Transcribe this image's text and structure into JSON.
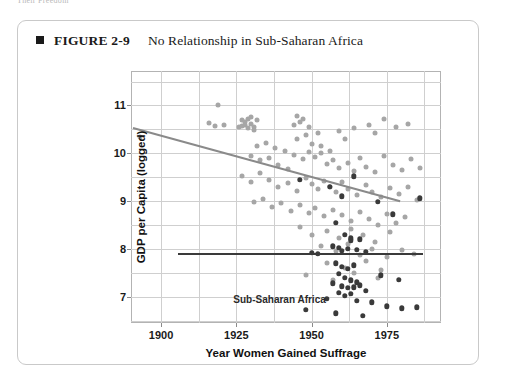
{
  "running_head": "Their Freedom",
  "figure": {
    "bullet_icon": "square-bullet-icon",
    "number": "FIGURE 2-9",
    "title": "No Relationship in Sub-Saharan Africa"
  },
  "colors": {
    "ssa_point": "#3a3a3a",
    "other_point": "#a6a6a6",
    "ssa_trend": "#3a3a3a",
    "other_trend": "#8a8a8a",
    "grid": "#cfcfcf",
    "frame": "#b3b3b3"
  },
  "annotations": {
    "ssa_label": "Sub-Saharan Africa"
  },
  "chart_data": {
    "type": "scatter",
    "title": "No Relationship in Sub-Saharan Africa",
    "xlabel": "Year Women Gained Suffrage",
    "ylabel": "GDP per Capita (logged)",
    "xlim": [
      1890,
      1993
    ],
    "ylim": [
      6.45,
      11.72
    ],
    "xticks": [
      1900,
      1925,
      1950,
      1975
    ],
    "xticklabels": [
      "1900",
      "1925",
      "1950",
      "1975"
    ],
    "yticks": [
      7,
      8,
      9,
      10,
      11
    ],
    "yticklabels": [
      "7",
      "8",
      "9",
      "10",
      "11"
    ],
    "x_minor_step": 12.5,
    "y_minor_step": 0.5,
    "grid": true,
    "legend": "none",
    "series": [
      {
        "name": "Rest of world",
        "color": "#a6a6a6",
        "points": [
          [
            1893,
            10.35
          ],
          [
            1918,
            10.58
          ],
          [
            1921,
            10.59
          ],
          [
            1919,
            11.0
          ],
          [
            1916,
            10.63
          ],
          [
            1927,
            10.7
          ],
          [
            1928,
            10.66
          ],
          [
            1929,
            10.72
          ],
          [
            1928,
            10.6
          ],
          [
            1930,
            10.62
          ],
          [
            1931,
            10.55
          ],
          [
            1927,
            10.58
          ],
          [
            1929,
            10.52
          ],
          [
            1932,
            10.7
          ],
          [
            1930,
            10.75
          ],
          [
            1926,
            10.55
          ],
          [
            1931,
            10.48
          ],
          [
            1945,
            10.78
          ],
          [
            1946,
            10.66
          ],
          [
            1944,
            10.6
          ],
          [
            1947,
            10.72
          ],
          [
            1949,
            10.54
          ],
          [
            1948,
            10.38
          ],
          [
            1945,
            10.3
          ],
          [
            1952,
            10.42
          ],
          [
            1950,
            10.2
          ],
          [
            1953,
            10.15
          ],
          [
            1956,
            10.05
          ],
          [
            1959,
            10.46
          ],
          [
            1961,
            10.3
          ],
          [
            1964,
            10.52
          ],
          [
            1969,
            10.6
          ],
          [
            1971,
            10.43
          ],
          [
            1974,
            10.72
          ],
          [
            1978,
            10.55
          ],
          [
            1982,
            10.62
          ],
          [
            1932,
            10.15
          ],
          [
            1935,
            10.22
          ],
          [
            1938,
            10.1
          ],
          [
            1941,
            10.05
          ],
          [
            1930,
            9.95
          ],
          [
            1933,
            9.86
          ],
          [
            1936,
            9.9
          ],
          [
            1939,
            9.75
          ],
          [
            1942,
            9.68
          ],
          [
            1944,
            9.96
          ],
          [
            1947,
            9.88
          ],
          [
            1949,
            10.02
          ],
          [
            1951,
            9.92
          ],
          [
            1953,
            10.0
          ],
          [
            1955,
            9.78
          ],
          [
            1957,
            9.85
          ],
          [
            1959,
            9.7
          ],
          [
            1962,
            9.8
          ],
          [
            1964,
            9.62
          ],
          [
            1966,
            9.9
          ],
          [
            1968,
            9.72
          ],
          [
            1971,
            9.6
          ],
          [
            1974,
            9.95
          ],
          [
            1977,
            9.75
          ],
          [
            1980,
            9.65
          ],
          [
            1983,
            9.88
          ],
          [
            1986,
            9.7
          ],
          [
            1927,
            9.52
          ],
          [
            1930,
            9.4
          ],
          [
            1933,
            9.58
          ],
          [
            1936,
            9.45
          ],
          [
            1939,
            9.3
          ],
          [
            1942,
            9.38
          ],
          [
            1945,
            9.22
          ],
          [
            1948,
            9.48
          ],
          [
            1950,
            9.35
          ],
          [
            1952,
            9.25
          ],
          [
            1954,
            9.42
          ],
          [
            1956,
            9.3
          ],
          [
            1958,
            9.18
          ],
          [
            1960,
            9.4
          ],
          [
            1962,
            9.26
          ],
          [
            1965,
            9.12
          ],
          [
            1968,
            9.34
          ],
          [
            1970,
            9.2
          ],
          [
            1973,
            9.08
          ],
          [
            1976,
            9.28
          ],
          [
            1979,
            9.14
          ],
          [
            1982,
            9.3
          ],
          [
            1985,
            9.02
          ],
          [
            1931,
            8.98
          ],
          [
            1934,
            9.05
          ],
          [
            1937,
            8.88
          ],
          [
            1940,
            8.95
          ],
          [
            1943,
            8.8
          ],
          [
            1946,
            8.92
          ],
          [
            1949,
            8.75
          ],
          [
            1951,
            8.86
          ],
          [
            1954,
            8.68
          ],
          [
            1957,
            8.82
          ],
          [
            1960,
            8.7
          ],
          [
            1963,
            8.58
          ],
          [
            1966,
            8.78
          ],
          [
            1969,
            8.62
          ],
          [
            1972,
            8.5
          ],
          [
            1975,
            8.72
          ],
          [
            1978,
            8.55
          ],
          [
            1981,
            8.66
          ],
          [
            1946,
            8.45
          ],
          [
            1950,
            8.3
          ],
          [
            1955,
            8.38
          ],
          [
            1959,
            8.22
          ],
          [
            1963,
            8.42
          ],
          [
            1967,
            8.28
          ],
          [
            1971,
            8.15
          ],
          [
            1976,
            8.35
          ],
          [
            1953,
            8.05
          ],
          [
            1958,
            7.95
          ],
          [
            1962,
            8.1
          ],
          [
            1966,
            7.88
          ],
          [
            1970,
            8.0
          ],
          [
            1975,
            7.82
          ],
          [
            1980,
            7.98
          ],
          [
            1984,
            7.9
          ],
          [
            1955,
            7.7
          ],
          [
            1961,
            7.6
          ],
          [
            1968,
            7.75
          ],
          [
            1973,
            7.55
          ],
          [
            1948,
            7.45
          ],
          [
            1957,
            7.35
          ],
          [
            1964,
            7.5
          ],
          [
            1972,
            7.4
          ]
        ]
      },
      {
        "name": "Sub-Saharan Africa",
        "color": "#3a3a3a",
        "points": [
          [
            1946,
            9.44
          ],
          [
            1956,
            9.3
          ],
          [
            1960,
            9.1
          ],
          [
            1964,
            9.52
          ],
          [
            1972,
            8.98
          ],
          [
            1977,
            8.72
          ],
          [
            1958,
            8.55
          ],
          [
            1961,
            8.3
          ],
          [
            1963,
            8.22
          ],
          [
            1957,
            8.05
          ],
          [
            1959,
            8.02
          ],
          [
            1962,
            8.0
          ],
          [
            1965,
            7.98
          ],
          [
            1960,
            7.96
          ],
          [
            1963,
            8.18
          ],
          [
            1966,
            8.2
          ],
          [
            1950,
            7.92
          ],
          [
            1952,
            7.9
          ],
          [
            1968,
            7.94
          ],
          [
            1958,
            7.7
          ],
          [
            1960,
            7.62
          ],
          [
            1962,
            7.58
          ],
          [
            1964,
            7.66
          ],
          [
            1959,
            7.48
          ],
          [
            1961,
            7.4
          ],
          [
            1963,
            7.34
          ],
          [
            1965,
            7.3
          ],
          [
            1957,
            7.28
          ],
          [
            1960,
            7.22
          ],
          [
            1962,
            7.18
          ],
          [
            1964,
            7.2
          ],
          [
            1966,
            7.24
          ],
          [
            1959,
            7.08
          ],
          [
            1961,
            7.02
          ],
          [
            1963,
            7.06
          ],
          [
            1955,
            6.95
          ],
          [
            1965,
            6.92
          ],
          [
            1970,
            6.88
          ],
          [
            1975,
            6.8
          ],
          [
            1980,
            6.76
          ],
          [
            1948,
            6.72
          ],
          [
            1968,
            7.12
          ],
          [
            1973,
            7.45
          ],
          [
            1979,
            7.35
          ],
          [
            1986,
            9.06
          ],
          [
            1985,
            6.78
          ],
          [
            1958,
            6.65
          ],
          [
            1967,
            6.6
          ]
        ]
      }
    ],
    "trend_lines": [
      {
        "name": "Rest of world fit",
        "color": "#8a8a8a",
        "x": [
          1890.8,
          1979.5
        ],
        "y": [
          10.55,
          9.02
        ],
        "slope_sign": "negative"
      },
      {
        "name": "Sub-Saharan Africa fit",
        "color": "#3a3a3a",
        "x": [
          1905.5,
          1987.0
        ],
        "y": [
          7.92,
          7.92
        ],
        "slope_sign": "flat"
      }
    ]
  }
}
